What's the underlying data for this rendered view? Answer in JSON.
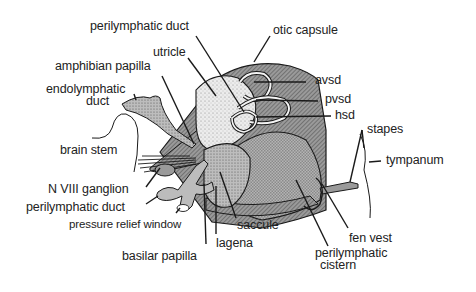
{
  "diagram": {
    "labels": {
      "perilymphatic_duct_top": "perilymphatic duct",
      "otic_capsule": "otic capsule",
      "utricle": "utricle",
      "amphibian_papilla": "amphibian papilla",
      "endolymphatic_duct_1": "endolymphatic",
      "endolymphatic_duct_2": "duct",
      "avsd": "avsd",
      "pvsd": "pvsd",
      "hsd": "hsd",
      "stapes": "stapes",
      "tympanum": "tympanum",
      "brain_stem": "brain stem",
      "n_viii_ganglion": "N VIII ganglion",
      "perilymphatic_duct_bottom": "perilymphatic duct",
      "pressure_relief_window": "pressure relief window",
      "saccule": "saccule",
      "fen_vest": "fen vest",
      "basilar_papilla": "basilar papilla",
      "lagena": "lagena",
      "perilymphatic_cistern_1": "perilymphatic",
      "perilymphatic_cistern_2": "cistern"
    },
    "colors": {
      "outline": "#1a1a1a",
      "capsule_hatch": "#7a7a7a",
      "stipple": "#d8d8d8",
      "cistern": "#a9a9a9",
      "duct": "#b9b9b9",
      "background": "#ffffff"
    }
  }
}
